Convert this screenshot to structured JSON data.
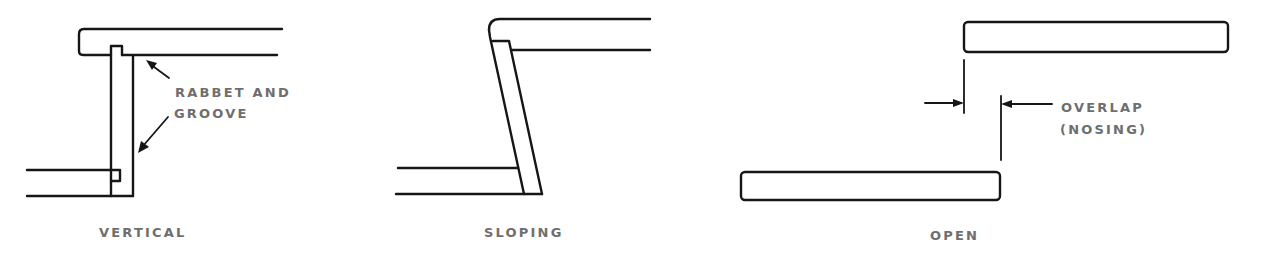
{
  "diagram": {
    "type": "technical-line-drawing",
    "colors": {
      "line": "#161616",
      "label": "#6e6e6e",
      "background": "#ffffff"
    },
    "panels": [
      {
        "id": "vertical",
        "caption": "VERTICAL",
        "callout": {
          "line1": "RABBET AND",
          "line2": "GROOVE",
          "arrows": 2
        }
      },
      {
        "id": "sloping",
        "caption": "SLOPING"
      },
      {
        "id": "open",
        "caption": "OPEN",
        "callout": {
          "line1": "OVERLAP",
          "line2": "(NOSING)",
          "dimension_arrows": 2
        }
      }
    ]
  }
}
